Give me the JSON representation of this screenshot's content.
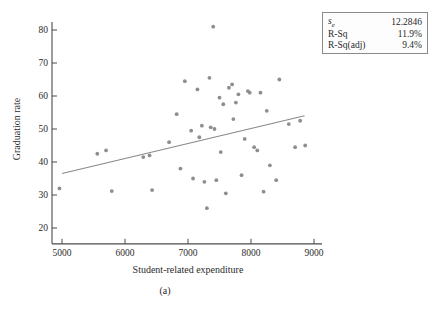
{
  "caption": "(a)",
  "stats": {
    "rows": [
      {
        "label_main": "s",
        "label_sub": "e",
        "value": "12.2846"
      },
      {
        "label_main": "R-Sq",
        "label_sub": "",
        "value": "11.9%"
      },
      {
        "label_main": "R-Sq(adj)",
        "label_sub": "",
        "value": "9.4%"
      }
    ]
  },
  "chart_data": {
    "type": "scatter",
    "title": "",
    "xlabel": "Student-related expenditure",
    "ylabel": "Graduation rate",
    "xlim": [
      4700,
      9100
    ],
    "ylim": [
      15,
      84
    ],
    "xticks": [
      5000,
      6000,
      7000,
      8000,
      9000
    ],
    "yticks": [
      20,
      30,
      40,
      50,
      60,
      70,
      80
    ],
    "grid": false,
    "legend_position": "top-right",
    "point_color": "#8e8e92",
    "line_color": "#8a8a8e",
    "regression_line": {
      "x": [
        5000,
        8850
      ],
      "y": [
        36.5,
        54.0
      ]
    },
    "points": [
      {
        "x": 4960,
        "y": 32.0
      },
      {
        "x": 5560,
        "y": 42.5
      },
      {
        "x": 5700,
        "y": 43.5
      },
      {
        "x": 5790,
        "y": 31.2
      },
      {
        "x": 6290,
        "y": 41.5
      },
      {
        "x": 6390,
        "y": 42.0
      },
      {
        "x": 6430,
        "y": 31.5
      },
      {
        "x": 6700,
        "y": 46.0
      },
      {
        "x": 6820,
        "y": 54.5
      },
      {
        "x": 6880,
        "y": 38.0
      },
      {
        "x": 6950,
        "y": 64.5
      },
      {
        "x": 7050,
        "y": 49.5
      },
      {
        "x": 7080,
        "y": 35.0
      },
      {
        "x": 7150,
        "y": 62.0
      },
      {
        "x": 7180,
        "y": 47.5
      },
      {
        "x": 7220,
        "y": 51.0
      },
      {
        "x": 7260,
        "y": 34.0
      },
      {
        "x": 7300,
        "y": 26.0
      },
      {
        "x": 7340,
        "y": 65.5
      },
      {
        "x": 7360,
        "y": 50.5
      },
      {
        "x": 7400,
        "y": 81.0
      },
      {
        "x": 7420,
        "y": 50.0
      },
      {
        "x": 7450,
        "y": 34.5
      },
      {
        "x": 7500,
        "y": 59.5
      },
      {
        "x": 7520,
        "y": 43.0
      },
      {
        "x": 7560,
        "y": 57.5
      },
      {
        "x": 7600,
        "y": 30.5
      },
      {
        "x": 7650,
        "y": 62.5
      },
      {
        "x": 7700,
        "y": 63.5
      },
      {
        "x": 7720,
        "y": 53.0
      },
      {
        "x": 7760,
        "y": 58.0
      },
      {
        "x": 7800,
        "y": 60.5
      },
      {
        "x": 7850,
        "y": 36.0
      },
      {
        "x": 7900,
        "y": 47.0
      },
      {
        "x": 7950,
        "y": 61.5
      },
      {
        "x": 7980,
        "y": 61.0
      },
      {
        "x": 8050,
        "y": 44.5
      },
      {
        "x": 8100,
        "y": 43.5
      },
      {
        "x": 8150,
        "y": 61.0
      },
      {
        "x": 8200,
        "y": 31.0
      },
      {
        "x": 8250,
        "y": 55.5
      },
      {
        "x": 8300,
        "y": 39.0
      },
      {
        "x": 8400,
        "y": 34.5
      },
      {
        "x": 8450,
        "y": 65.0
      },
      {
        "x": 8600,
        "y": 51.5
      },
      {
        "x": 8700,
        "y": 44.5
      },
      {
        "x": 8780,
        "y": 52.5
      },
      {
        "x": 8860,
        "y": 45.0
      }
    ]
  }
}
